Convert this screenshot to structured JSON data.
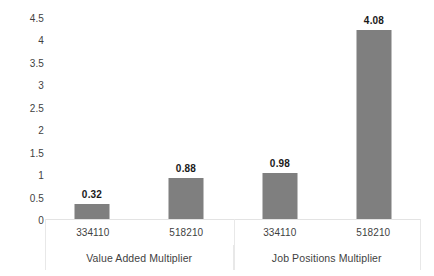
{
  "chart_data": {
    "type": "bar",
    "title": "",
    "xlabel": "",
    "ylabel": "",
    "ylim": [
      0,
      4.5
    ],
    "grid": false,
    "legend": "none",
    "y_ticks": [
      "0",
      "0.5",
      "1",
      "1.5",
      "2",
      "2.5",
      "3",
      "3.5",
      "4",
      "4.5"
    ],
    "y_tick_values": [
      0,
      0.5,
      1,
      1.5,
      2,
      2.5,
      3,
      3.5,
      4,
      4.5
    ],
    "categories": [
      "334110",
      "518210",
      "334110",
      "518210"
    ],
    "groups": [
      {
        "label": "Value Added Multiplier",
        "categories": [
          "334110",
          "518210"
        ],
        "values": [
          0.32,
          0.88
        ]
      },
      {
        "label": "Job Positions Multiplier",
        "categories": [
          "334110",
          "518210"
        ],
        "values": [
          0.98,
          4.08
        ]
      }
    ],
    "values": [
      0.32,
      0.88,
      0.98,
      4.08
    ],
    "data_labels": [
      "0.32",
      "0.88",
      "0.98",
      "4.08"
    ],
    "bar_color": "#7f7f7f",
    "axis_color": "#e8e8e8",
    "text_color": "#3f3f3f"
  }
}
